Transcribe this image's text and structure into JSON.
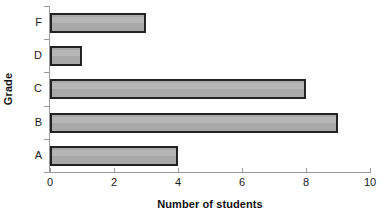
{
  "chart_data": {
    "type": "bar",
    "orientation": "horizontal",
    "title": "",
    "xlabel": "Number of students",
    "ylabel": "Grade",
    "categories": [
      "A",
      "B",
      "C",
      "D",
      "F"
    ],
    "values": [
      4,
      9,
      8,
      1,
      3
    ],
    "category_order_top_to_bottom": [
      "F",
      "D",
      "C",
      "B",
      "A"
    ],
    "xlim": [
      0,
      10
    ],
    "xticks": [
      0,
      2,
      4,
      6,
      8,
      10
    ],
    "xtick_labels": [
      "0",
      "2",
      "4",
      "6",
      "8",
      "10"
    ],
    "grid": false,
    "legend": null,
    "bar_fill_color": "#a9a9a9",
    "bar_border_color": "#232323",
    "axis_color": "#9a9a9a",
    "text_color": "#1a1a1a",
    "background_color": "#ffffff",
    "bars": [
      {
        "category": "F",
        "value": 3
      },
      {
        "category": "D",
        "value": 1
      },
      {
        "category": "C",
        "value": 8
      },
      {
        "category": "B",
        "value": 9
      },
      {
        "category": "A",
        "value": 4
      }
    ]
  }
}
